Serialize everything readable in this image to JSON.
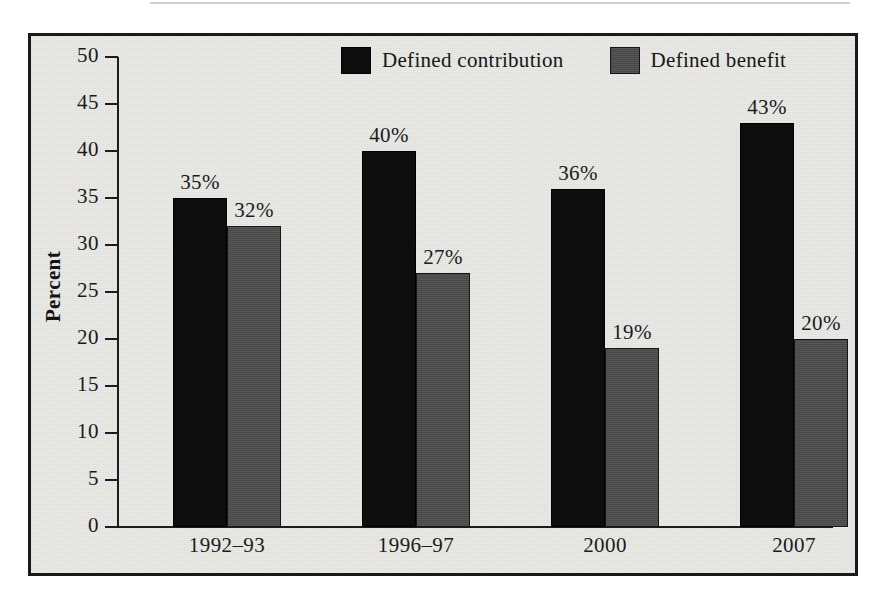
{
  "chart_data": {
    "type": "bar",
    "title": "",
    "subtitle": "",
    "xlabel": "",
    "ylabel": "Percent",
    "ylim": [
      0,
      50
    ],
    "ytick_step": 5,
    "yticks": [
      "50",
      "45",
      "40",
      "35",
      "30",
      "25",
      "20",
      "15",
      "10",
      "5",
      "0"
    ],
    "grid": false,
    "legend_position": "top-center",
    "categories": [
      "1992–93",
      "1996–97",
      "2000",
      "2007"
    ],
    "series": [
      {
        "name": "Defined contribution",
        "color": "#0d0d0d",
        "values": [
          35,
          40,
          36,
          43
        ],
        "labels": [
          "35%",
          "40%",
          "36%",
          "43%"
        ]
      },
      {
        "name": "Defined benefit",
        "color": "#4c4c4c",
        "values": [
          32,
          27,
          19,
          20
        ],
        "labels": [
          "32%",
          "27%",
          "19%",
          "20%"
        ]
      }
    ]
  },
  "legend": {
    "items": [
      {
        "label": "Defined contribution",
        "swatch": "black-swatch-icon"
      },
      {
        "label": "Defined benefit",
        "swatch": "gray-swatch-icon"
      }
    ]
  },
  "axes": {
    "y_title": "Percent",
    "y_tick_labels": [
      "50",
      "45",
      "40",
      "35",
      "30",
      "25",
      "20",
      "15",
      "10",
      "5",
      "0"
    ],
    "x_tick_labels": [
      "1992–93",
      "1996–97",
      "2000",
      "2007"
    ]
  },
  "colors": {
    "background": "#e9e9e6",
    "frame": "#1a1a1a",
    "axis": "#1c1c1c",
    "series_defined_contribution": "#0d0d0d",
    "series_defined_benefit": "#4c4c4c",
    "text": "#1b1b1b"
  }
}
